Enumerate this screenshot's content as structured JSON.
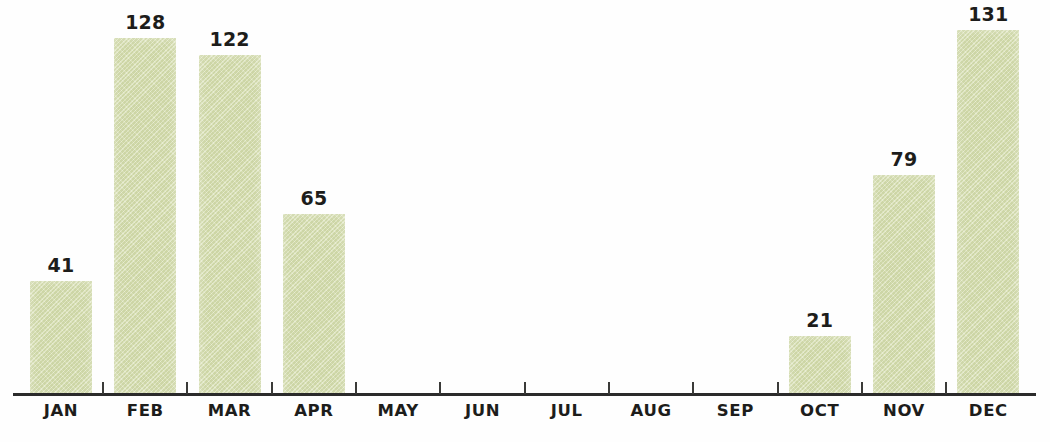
{
  "chart_data": {
    "type": "bar",
    "title": "",
    "subtitle": "",
    "xlabel": "",
    "ylabel": "",
    "categories": [
      "JAN",
      "FEB",
      "MAR",
      "APR",
      "MAY",
      "JUN",
      "JUL",
      "AUG",
      "SEP",
      "OCT",
      "NOV",
      "DEC"
    ],
    "values": [
      41,
      128,
      122,
      65,
      0,
      0,
      0,
      0,
      0,
      21,
      79,
      131
    ],
    "value_labels": [
      "41",
      "128",
      "122",
      "65",
      "",
      "",
      "",
      "",
      "",
      "21",
      "79",
      "131"
    ],
    "ylim": [
      0,
      142
    ],
    "grid": false,
    "legend": false,
    "legend_position": "none",
    "bar_color": "#d7dfb0",
    "label_color": "#1d1d1b",
    "axis_color": "#2b2b2b"
  },
  "axis": {
    "tick_count": 11
  }
}
